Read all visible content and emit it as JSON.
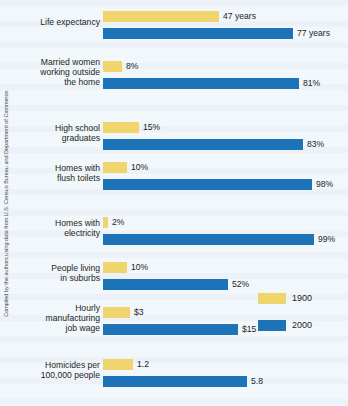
{
  "credit": {
    "text": "Compiled by the authors using data from U.S. Census Bureau and Department of Commerce."
  },
  "legend": {
    "items": [
      {
        "label": "1900",
        "color": "#efd56c",
        "swatch": "yellow-swatch"
      },
      {
        "label": "2000",
        "color": "#1c73b7",
        "swatch": "blue-swatch"
      }
    ]
  },
  "chart_data": {
    "type": "bar",
    "title": "",
    "subtitle": "",
    "xlabel": "",
    "ylabel": "",
    "orientation": "horizontal",
    "grid": false,
    "legend_position": "right-bottom",
    "note": "Each category is scaled independently; bar lengths are relative within the figure.",
    "categories": [
      "Life expectancy",
      "Married women working outside the home",
      "High school graduates",
      "Homes with flush toilets",
      "Homes with electricity",
      "People living in suburbs",
      "Hourly manufacturing job wage",
      "Homicides per 100,000 people"
    ],
    "series": [
      {
        "name": "1900",
        "color": "#efd56c",
        "values": [
          47,
          8,
          15,
          10,
          2,
          10,
          3,
          1.2
        ],
        "labels": [
          "47 years",
          "8%",
          "15%",
          "10%",
          "2%",
          "10%",
          "$3",
          "1.2"
        ]
      },
      {
        "name": "2000",
        "color": "#1c73b7",
        "values": [
          77,
          81,
          83,
          98,
          99,
          52,
          15,
          5.8
        ],
        "labels": [
          "77 years",
          "81%",
          "83%",
          "98%",
          "99%",
          "52%",
          "$15",
          "5.8"
        ]
      }
    ],
    "rows": [
      {
        "label": "Life expectancy",
        "label_lines": [
          "Life expectancy"
        ],
        "y": 11,
        "y1900": {
          "value": 47,
          "label": "47 years",
          "bar_px": 116
        },
        "y2000": {
          "value": 77,
          "label": "77 years",
          "bar_px": 190
        }
      },
      {
        "label": "Married women working outside the home",
        "label_lines": [
          "Married women",
          "working outside",
          "the home"
        ],
        "y": 61,
        "y1900": {
          "value": 8,
          "label": "8%",
          "bar_px": 19
        },
        "y2000": {
          "value": 81,
          "label": "81%",
          "bar_px": 196
        }
      },
      {
        "label": "High school graduates",
        "label_lines": [
          "High school",
          "graduates"
        ],
        "y": 122,
        "y1900": {
          "value": 15,
          "label": "15%",
          "bar_px": 36
        },
        "y2000": {
          "value": 83,
          "label": "83%",
          "bar_px": 200
        }
      },
      {
        "label": "Homes with flush toilets",
        "label_lines": [
          "Homes with",
          "flush toilets"
        ],
        "y": 162,
        "y1900": {
          "value": 10,
          "label": "10%",
          "bar_px": 24
        },
        "y2000": {
          "value": 98,
          "label": "98%",
          "bar_px": 209
        }
      },
      {
        "label": "Homes with electricity",
        "label_lines": [
          "Homes with",
          "electricity"
        ],
        "y": 217,
        "y1900": {
          "value": 2,
          "label": "2%",
          "bar_px": 5
        },
        "y2000": {
          "value": 99,
          "label": "99%",
          "bar_px": 211
        }
      },
      {
        "label": "People living in suburbs",
        "label_lines": [
          "People living",
          "in suburbs"
        ],
        "y": 262,
        "y1900": {
          "value": 10,
          "label": "10%",
          "bar_px": 24
        },
        "y2000": {
          "value": 52,
          "label": "52%",
          "bar_px": 125
        }
      },
      {
        "label": "Hourly manufacturing job wage",
        "label_lines": [
          "Hourly",
          "manufacturing",
          "job wage"
        ],
        "y": 307,
        "y1900": {
          "value": 3,
          "label": "$3",
          "bar_px": 27
        },
        "y2000": {
          "value": 15,
          "label": "$15",
          "bar_px": 135
        }
      },
      {
        "label": "Homicides per 100,000 people",
        "label_lines": [
          "Homicides per",
          "100,000 people"
        ],
        "y": 359,
        "y1900": {
          "value": 1.2,
          "label": "1.2",
          "bar_px": 30
        },
        "y2000": {
          "value": 5.8,
          "label": "5.8",
          "bar_px": 144
        }
      }
    ]
  }
}
